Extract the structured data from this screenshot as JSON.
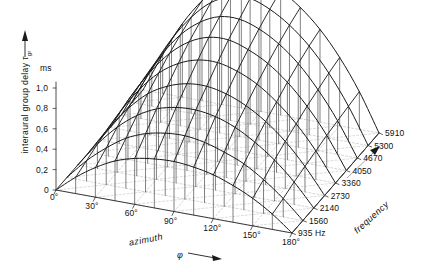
{
  "chart_data": {
    "type": "surface",
    "title": "",
    "zlabel": "interaural group delay",
    "zsymbol": "τ",
    "zsubscript": "gr",
    "zunit": "ms",
    "zticks": [
      "0",
      "0,2",
      "0,4",
      "0,6",
      "0,8",
      "1,0"
    ],
    "zvalues": [
      0,
      0.2,
      0.4,
      0.6,
      0.8,
      1.0
    ],
    "zlim": [
      0,
      1.0
    ],
    "xlabel": "azimuth",
    "xsymbol": "φ",
    "xticks": [
      "0°",
      "30°",
      "60°",
      "90°",
      "120°",
      "150°",
      "180°"
    ],
    "xvalues": [
      0,
      30,
      60,
      90,
      120,
      150,
      180
    ],
    "ylabel": "frequency",
    "yticks": [
      "935 Hz",
      "1560",
      "2140",
      "2730",
      "3360",
      "4050",
      "4670",
      "5300",
      "5910"
    ],
    "yvalues": [
      935,
      1560,
      2140,
      2730,
      3360,
      4050,
      4670,
      5300,
      5910
    ],
    "grid": true,
    "legend": "none",
    "azimuth_samples": [
      0,
      15,
      30,
      45,
      60,
      75,
      90,
      105,
      120,
      135,
      150,
      165,
      180
    ],
    "surface": [
      {
        "freq": 935,
        "values": [
          0.0,
          0.16,
          0.29,
          0.39,
          0.45,
          0.48,
          0.49,
          0.47,
          0.43,
          0.36,
          0.27,
          0.15,
          0.0
        ]
      },
      {
        "freq": 1560,
        "values": [
          0.0,
          0.2,
          0.36,
          0.49,
          0.57,
          0.61,
          0.62,
          0.59,
          0.53,
          0.45,
          0.33,
          0.18,
          0.0
        ]
      },
      {
        "freq": 2140,
        "values": [
          0.0,
          0.24,
          0.44,
          0.59,
          0.69,
          0.74,
          0.75,
          0.72,
          0.65,
          0.54,
          0.4,
          0.22,
          0.0
        ]
      },
      {
        "freq": 2730,
        "values": [
          0.0,
          0.27,
          0.5,
          0.68,
          0.79,
          0.85,
          0.86,
          0.82,
          0.74,
          0.62,
          0.46,
          0.25,
          0.0
        ]
      },
      {
        "freq": 3360,
        "values": [
          0.0,
          0.3,
          0.56,
          0.76,
          0.89,
          0.96,
          0.97,
          0.92,
          0.83,
          0.69,
          0.51,
          0.28,
          0.0
        ]
      },
      {
        "freq": 4050,
        "values": [
          0.0,
          0.33,
          0.61,
          0.83,
          0.98,
          1.06,
          1.07,
          1.01,
          0.91,
          0.76,
          0.56,
          0.31,
          0.0
        ]
      },
      {
        "freq": 4670,
        "values": [
          0.0,
          0.35,
          0.65,
          0.89,
          1.05,
          1.14,
          1.15,
          1.09,
          0.98,
          0.82,
          0.6,
          0.33,
          0.0
        ]
      },
      {
        "freq": 5300,
        "values": [
          0.0,
          0.37,
          0.69,
          0.94,
          1.12,
          1.21,
          1.23,
          1.16,
          1.04,
          0.87,
          0.64,
          0.35,
          0.0
        ]
      },
      {
        "freq": 5910,
        "values": [
          0.0,
          0.38,
          0.72,
          0.98,
          1.17,
          1.27,
          1.29,
          1.22,
          1.09,
          0.91,
          0.67,
          0.37,
          0.0
        ]
      }
    ],
    "colors": {
      "mesh": "#1a1a1a",
      "basegrid": "#b9b9b9",
      "dropline": "#555555",
      "axis": "#3a3a3a"
    }
  },
  "axes": {
    "origin_label": "0°",
    "z_arrow": "up-arrow-icon",
    "x_arrow": "right-arrow-icon",
    "y_arrow": "diagonal-arrow-icon"
  }
}
